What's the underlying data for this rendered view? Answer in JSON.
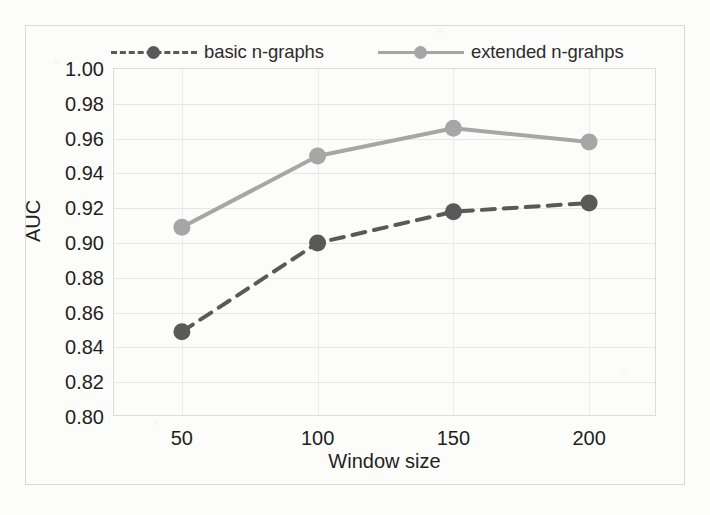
{
  "figure": {
    "background_color": "#fcfcfa",
    "frame_color": "#d9d9d6",
    "plot_border_color": "#dcdcd8",
    "gridline_color": "#e6e6e2"
  },
  "legend": {
    "position": "top",
    "entries": [
      {
        "label": "basic n-graphs",
        "color": "#595959",
        "style": "dashed",
        "marker": "circle"
      },
      {
        "label": "extended n-grahps",
        "color": "#a6a6a6",
        "style": "solid",
        "marker": "circle"
      }
    ]
  },
  "chart_data": {
    "type": "line",
    "title": "",
    "xlabel": "Window size",
    "ylabel": "AUC",
    "categories": [
      "50",
      "100",
      "150",
      "200"
    ],
    "x": [
      50,
      100,
      150,
      200
    ],
    "xlim": [
      25,
      225
    ],
    "ylim": [
      0.8,
      1.0
    ],
    "ytick_step": 0.02,
    "yticks": [
      "1.00",
      "0.98",
      "0.96",
      "0.94",
      "0.92",
      "0.90",
      "0.88",
      "0.86",
      "0.84",
      "0.82",
      "0.80"
    ],
    "ytick_values": [
      1.0,
      0.98,
      0.96,
      0.94,
      0.92,
      0.9,
      0.88,
      0.86,
      0.84,
      0.82,
      0.8
    ],
    "grid": true,
    "grid_axis": "both",
    "legend_position": "top",
    "markers": true,
    "series": [
      {
        "name": "basic n-graphs",
        "color": "#595959",
        "style": "dashed",
        "values": [
          0.849,
          0.9,
          0.918,
          0.923
        ]
      },
      {
        "name": "extended n-grahps",
        "color": "#a6a6a6",
        "style": "solid",
        "values": [
          0.909,
          0.95,
          0.966,
          0.958
        ]
      }
    ]
  }
}
